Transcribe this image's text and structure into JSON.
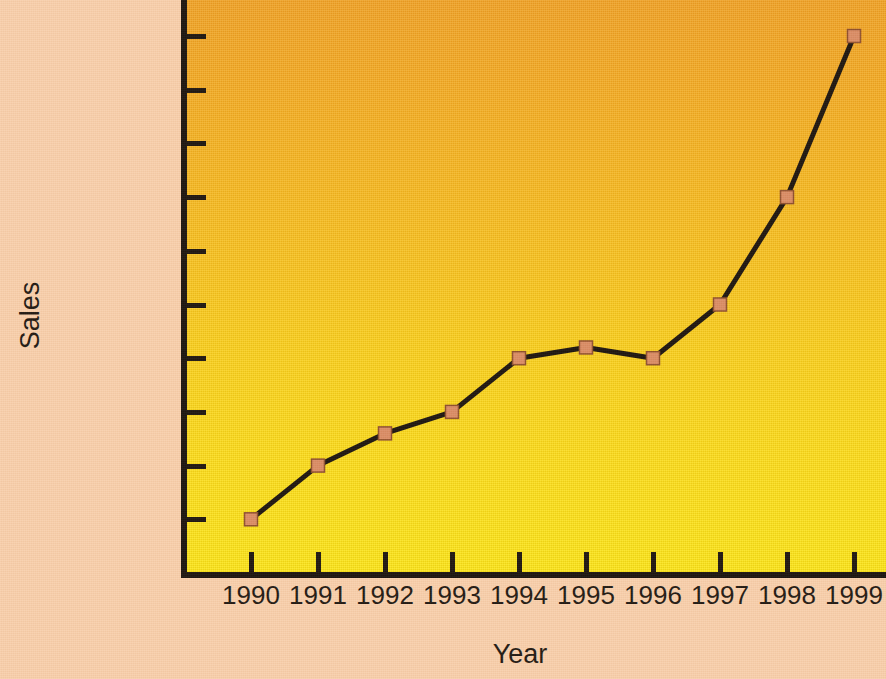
{
  "chart_data": {
    "type": "line",
    "title": "",
    "xlabel": "Year",
    "ylabel": "Sales",
    "categories": [
      "1990",
      "1991",
      "1992",
      "1993",
      "1994",
      "1995",
      "1996",
      "1997",
      "1998",
      "1999"
    ],
    "values": [
      100,
      200,
      260,
      300,
      400,
      420,
      400,
      500,
      700,
      1000
    ],
    "series": [
      {
        "name": "Sales",
        "values": [
          100,
          200,
          260,
          300,
          400,
          420,
          400,
          500,
          700,
          1000
        ]
      }
    ],
    "x": [
      1990,
      1991,
      1992,
      1993,
      1994,
      1995,
      1996,
      1997,
      1998,
      1999
    ],
    "ylim": [
      0,
      1000
    ],
    "xlim": [
      1990,
      1999
    ],
    "y_tick_values": [
      100,
      200,
      300,
      400,
      500,
      600,
      700,
      800,
      900,
      1000
    ],
    "y_tick_labels": [
      "100",
      "200",
      "300",
      "400",
      "500",
      "600",
      "700",
      "800",
      "900",
      "1 million"
    ],
    "x_tick_labels": [
      "1990",
      "1991",
      "1992",
      "1993",
      "1994",
      "1995",
      "1996",
      "1997",
      "1998",
      "1999"
    ],
    "grid": false,
    "legend": "none",
    "marker": "square",
    "colors": {
      "line": "#140e08",
      "marker_fill": "#d98a62",
      "marker_edge": "#8a4a28",
      "plot_bg_top": "#efa01f",
      "plot_bg_bottom": "#fbe612",
      "page_bg": "#f8cfab",
      "axis": "#120d08",
      "text": "#18120b"
    },
    "axes": {
      "y_label": "Sales",
      "x_label": "Year"
    }
  },
  "labels": {
    "y_title": "Sales",
    "x_title": "Year",
    "y_ticks": [
      "1 million",
      "900",
      "800",
      "700",
      "600",
      "500",
      "400",
      "300",
      "200",
      "100"
    ],
    "x_ticks": [
      "1990",
      "1991",
      "1992",
      "1993",
      "1994",
      "1995",
      "1996",
      "1997",
      "1998",
      "1999"
    ]
  }
}
